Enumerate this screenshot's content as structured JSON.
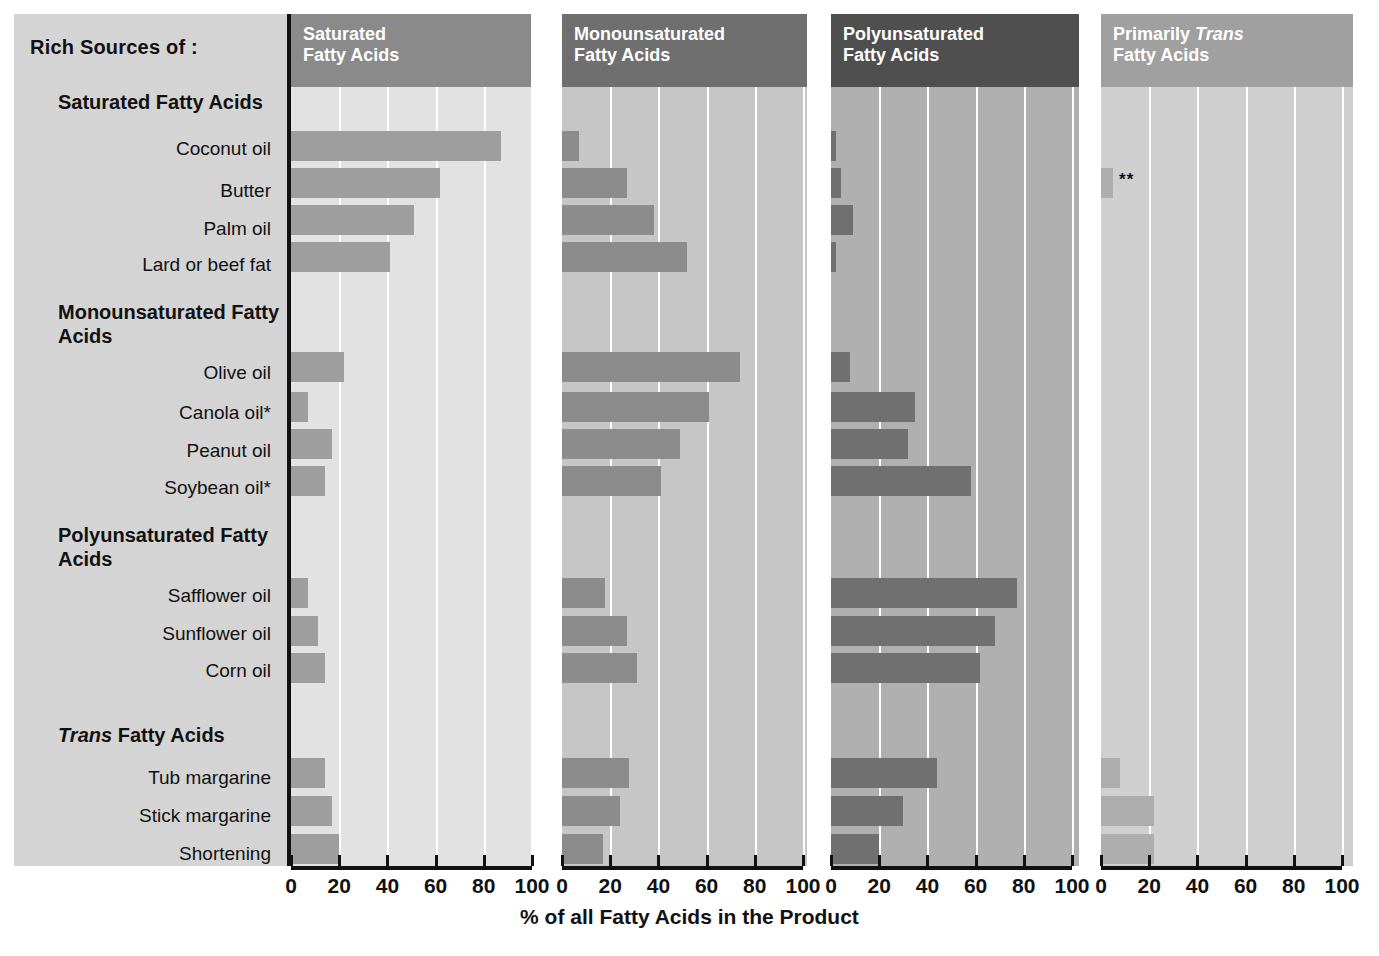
{
  "labels": {
    "rich_sources": "Rich Sources of :",
    "axis_title": "% of all Fatty Acids in the Product",
    "trans_note": "**"
  },
  "groups": [
    {
      "id": "saturated",
      "heading": "Saturated Fatty Acids",
      "heading_italic_prefix": null,
      "rows": [
        "Coconut oil",
        "Butter",
        "Palm oil",
        "Lard or beef fat"
      ]
    },
    {
      "id": "monounsaturated",
      "heading": "Monounsaturated Fatty Acids",
      "heading_italic_prefix": null,
      "rows": [
        "Olive oil",
        "Canola oil*",
        "Peanut oil",
        "Soybean oil*"
      ]
    },
    {
      "id": "polyunsaturated",
      "heading": "Polyunsaturated Fatty Acids",
      "heading_italic_prefix": null,
      "rows": [
        "Safflower oil",
        "Sunflower oil",
        "Corn oil"
      ]
    },
    {
      "id": "trans",
      "heading": "Fatty Acids",
      "heading_italic_prefix": "Trans",
      "rows": [
        "Tub margarine",
        "Stick margarine",
        "Shortening"
      ]
    }
  ],
  "panels": [
    {
      "id": "saturated",
      "title_line1": "Saturated",
      "title_line2": "Fatty Acids",
      "header_color": "#8a8a8a",
      "plot_color": "#e2e2e2",
      "bar_color": "#9e9e9e"
    },
    {
      "id": "monounsaturated",
      "title_line1": "Monounsaturated",
      "title_line2": "Fatty Acids",
      "header_color": "#6f6f6f",
      "plot_color": "#c6c6c6",
      "bar_color": "#8c8c8c"
    },
    {
      "id": "polyunsaturated",
      "title_line1": "Polyunsaturated",
      "title_line2": "Fatty Acids",
      "header_color": "#4f4f4f",
      "plot_color": "#b0b0b0",
      "bar_color": "#707070"
    },
    {
      "id": "trans",
      "title_line1_pre": "Primarily",
      "title_line1_ital": "Trans",
      "title_line2": "Fatty Acids",
      "header_color": "#a0a0a0",
      "plot_color": "#cfcfcf",
      "bar_color": "#adadad"
    }
  ],
  "chart_data": {
    "type": "bar",
    "xlabel": "% of all Fatty Acids in the Product",
    "ylabel": "",
    "xlim": [
      0,
      100
    ],
    "xticks": [
      0,
      20,
      40,
      60,
      80,
      100
    ],
    "grid": true,
    "legend_position": "column-headers",
    "orientation": "horizontal",
    "categories": [
      "Coconut oil",
      "Butter",
      "Palm oil",
      "Lard or beef fat",
      "Olive oil",
      "Canola oil*",
      "Peanut oil",
      "Soybean oil*",
      "Safflower oil",
      "Sunflower oil",
      "Corn oil",
      "Tub margarine",
      "Stick margarine",
      "Shortening"
    ],
    "series": [
      {
        "name": "Saturated Fatty Acids",
        "values": [
          87,
          62,
          51,
          41,
          22,
          7,
          17,
          14,
          7,
          11,
          14,
          14,
          17,
          20
        ]
      },
      {
        "name": "Monounsaturated Fatty Acids",
        "values": [
          7,
          27,
          38,
          52,
          74,
          61,
          49,
          41,
          18,
          27,
          31,
          28,
          24,
          17
        ]
      },
      {
        "name": "Polyunsaturated Fatty Acids",
        "values": [
          2,
          4,
          9,
          2,
          8,
          35,
          32,
          58,
          77,
          68,
          62,
          44,
          30,
          20
        ]
      },
      {
        "name": "Primarily Trans Fatty Acids",
        "values": [
          0,
          5,
          0,
          0,
          0,
          0,
          0,
          0,
          0,
          0,
          0,
          8,
          22,
          22
        ]
      }
    ],
    "annotations": [
      {
        "series": "Primarily Trans Fatty Acids",
        "category": "Butter",
        "text": "**"
      }
    ],
    "footnotes": [
      "*",
      "**"
    ]
  }
}
